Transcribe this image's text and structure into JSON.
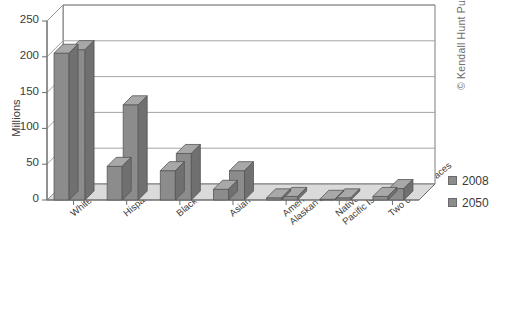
{
  "chart_data": {
    "type": "bar",
    "title": "",
    "subtitle": "",
    "xlabel": "",
    "ylabel": "Millions",
    "ylim": [
      0,
      250
    ],
    "yticks": [
      0,
      50,
      100,
      150,
      200,
      250
    ],
    "grid": true,
    "legend_position": "right",
    "style": "3d-clustered-column",
    "categories": [
      "White",
      "Hispanic",
      "Black",
      "Asian",
      "American Indian/\nAlaskan Native",
      "Native Hawaiian/\nPacific Islander",
      "Two or more races"
    ],
    "series": [
      {
        "name": "2008",
        "color": "#8c8c8c",
        "values": [
          205,
          47,
          41,
          15,
          3,
          1,
          5
        ]
      },
      {
        "name": "2050",
        "color": "#8c8c8c",
        "values": [
          210,
          133,
          65,
          41,
          5,
          3,
          16
        ]
      }
    ]
  },
  "legend": {
    "items": [
      {
        "label": "2008",
        "swatch_color": "#8c8c8c"
      },
      {
        "label": "2050",
        "swatch_color": "#8c8c8c"
      }
    ]
  },
  "credit": {
    "text": "© Kendall Hunt Publishing Company"
  },
  "caption": {
    "text": ""
  },
  "colors": {
    "bar_front": "#8c8c8c",
    "bar_top": "#a8a8a8",
    "bar_side": "#707070",
    "bar_outline": "#555555",
    "floor": "#dadada",
    "wall": "#ffffff",
    "gridline": "#9a9a9a",
    "axis": "#6d6d6d",
    "text": "#3a3a3a"
  }
}
